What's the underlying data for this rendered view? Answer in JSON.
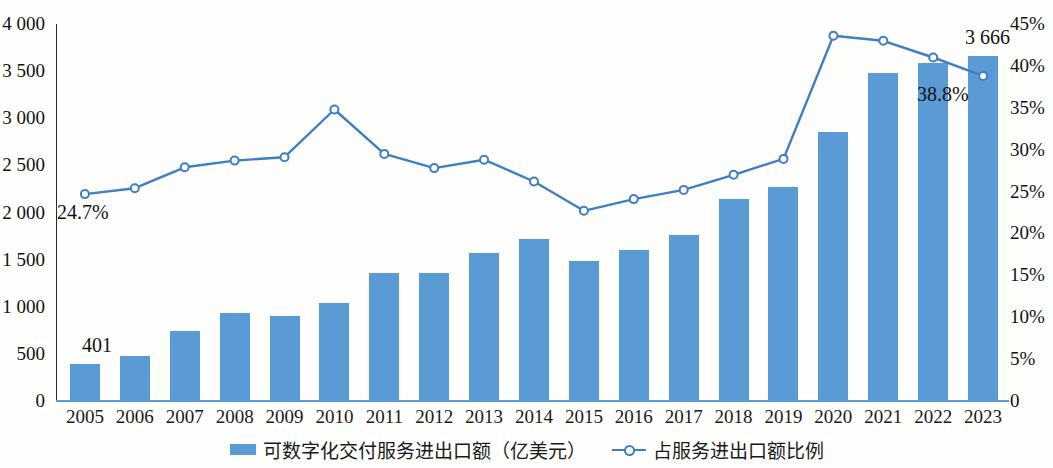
{
  "chart_data": {
    "type": "bar",
    "title": "",
    "subtitle": "",
    "xlabel": "",
    "ylabel": "",
    "y2label": "",
    "grid": false,
    "legend_position": "bottom",
    "categories": [
      "2005",
      "2006",
      "2007",
      "2008",
      "2009",
      "2010",
      "2011",
      "2012",
      "2013",
      "2014",
      "2015",
      "2016",
      "2017",
      "2018",
      "2019",
      "2020",
      "2021",
      "2022",
      "2023"
    ],
    "y_left_ticks": [
      "0",
      "500",
      "1 000",
      "1 500",
      "2 000",
      "2 500",
      "3 000",
      "3 500",
      "4 000"
    ],
    "y_right_ticks": [
      "0",
      "5%",
      "10%",
      "15%",
      "20%",
      "25%",
      "30%",
      "35%",
      "40%",
      "45%"
    ],
    "ylim": [
      0,
      4000
    ],
    "y2lim": [
      0,
      45
    ],
    "series": [
      {
        "name": "可数字化交付服务进出口额（亿美元）",
        "type": "bar",
        "axis": "left",
        "color": "#5b9bd5",
        "values": [
          401,
          484,
          758,
          945,
          912,
          1055,
          1374,
          1374,
          1578,
          1733,
          1497,
          1613,
          1767,
          2159,
          2281,
          2870,
          3494,
          3601,
          3666
        ]
      },
      {
        "name": "占服务进出口额比例",
        "type": "line",
        "axis": "right",
        "color": "#3f7fc1",
        "values": [
          24.7,
          25.4,
          27.9,
          28.7,
          29.1,
          34.8,
          29.5,
          27.8,
          28.8,
          26.2,
          22.7,
          24.1,
          25.2,
          27.0,
          28.9,
          43.6,
          43.0,
          41.0,
          38.8
        ]
      }
    ],
    "annotations": [
      {
        "name": "first-bar-value",
        "text": "401",
        "series": "bar",
        "category": "2005"
      },
      {
        "name": "last-bar-value",
        "text": "3 666",
        "series": "bar",
        "category": "2023"
      },
      {
        "name": "first-line-value",
        "text": "24.7%",
        "series": "line",
        "category": "2005"
      },
      {
        "name": "last-line-value",
        "text": "38.8%",
        "series": "line",
        "category": "2023"
      }
    ]
  },
  "legend": {
    "items": [
      {
        "label": "可数字化交付服务进出口额（亿美元）",
        "marker": "bar-swatch-icon",
        "color": "#5b9bd5"
      },
      {
        "label": "占服务进出口额比例",
        "marker": "line-marker-icon",
        "color": "#3f7fc1"
      }
    ]
  }
}
